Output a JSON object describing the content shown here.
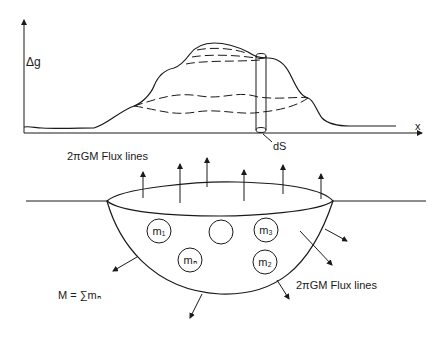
{
  "diagram": {
    "top_panel": {
      "y_axis_label": "Δg",
      "x_axis_label": "x",
      "surface_element_label": "dS",
      "colors": {
        "line": "#1a1a1a",
        "background": "#ffffff"
      }
    },
    "bottom_panel": {
      "flux_label_top": "2πGM  Flux lines",
      "flux_label_bottom": "2πGM  Flux lines",
      "mass_sum_label": "M = ∑mₙ",
      "masses": [
        {
          "id": "m1",
          "label": "m₁"
        },
        {
          "id": "m-blank",
          "label": ""
        },
        {
          "id": "m3",
          "label": "m₃"
        },
        {
          "id": "mn",
          "label": "mₙ"
        },
        {
          "id": "m2",
          "label": "m₂"
        }
      ]
    }
  }
}
